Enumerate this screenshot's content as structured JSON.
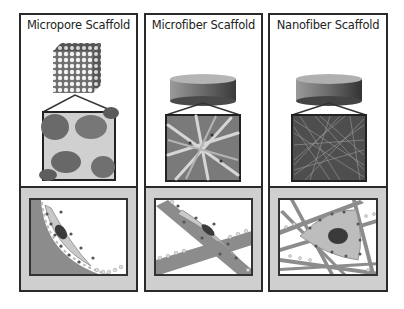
{
  "figure": {
    "panels": [
      {
        "id": "micropore",
        "title": "Micropore Scaffold",
        "macro_shape": "porous-cube",
        "micrograph": "micropore-sem",
        "cell_diagram": "cell-on-curved-pore-wall"
      },
      {
        "id": "microfiber",
        "title": "Microfiber Scaffold",
        "macro_shape": "disc-cylinder",
        "micrograph": "microfiber-sem",
        "cell_diagram": "cell-spread-on-single-fiber"
      },
      {
        "id": "nanofiber",
        "title": "Nanofiber Scaffold",
        "macro_shape": "disc-cylinder",
        "micrograph": "nanofiber-sem",
        "cell_diagram": "cell-spread-across-multiple-nanofibers"
      }
    ],
    "colors": {
      "border": "#2a2a2a",
      "bottom_bg": "#cfcfcf",
      "scaffold_gray": "#8c8c8c",
      "cell_body": "#bdbdbd",
      "nucleus": "#3a3a3a"
    }
  }
}
